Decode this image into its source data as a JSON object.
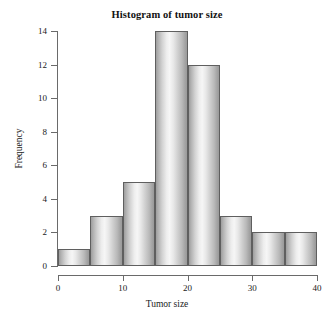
{
  "chart_data": {
    "type": "bar",
    "title": "Histogram of tumor size",
    "xlabel": "Tumor size",
    "ylabel": "Frequency",
    "bin_width": 5,
    "bin_edges": [
      0,
      5,
      10,
      15,
      20,
      25,
      30,
      35,
      40
    ],
    "categories": [
      "0-5",
      "5-10",
      "10-15",
      "15-20",
      "20-25",
      "25-30",
      "30-35",
      "35-40"
    ],
    "bin_starts": [
      0,
      5,
      10,
      15,
      20,
      25,
      30,
      35
    ],
    "values": [
      1,
      3,
      5,
      14,
      12,
      3,
      2,
      2
    ],
    "xlim": [
      0,
      40
    ],
    "ylim": [
      0,
      14
    ],
    "xticks": [
      0,
      10,
      20,
      30,
      40
    ],
    "xtick_labels": [
      "0",
      "10",
      "20",
      "30",
      "40"
    ],
    "yticks": [
      0,
      2,
      4,
      6,
      8,
      10,
      12,
      14
    ],
    "ytick_labels": [
      "0",
      "2",
      "4",
      "6",
      "8",
      "10",
      "12",
      "14"
    ],
    "grid": false,
    "legend": false,
    "total_count": 42,
    "bar_border_color": "#5f5f5f",
    "bar_fill_light": "#f6f6f6",
    "bar_fill_dark": "#9a9a9a",
    "axis_color": "#6a6a6a",
    "background_color": "#ffffff"
  }
}
